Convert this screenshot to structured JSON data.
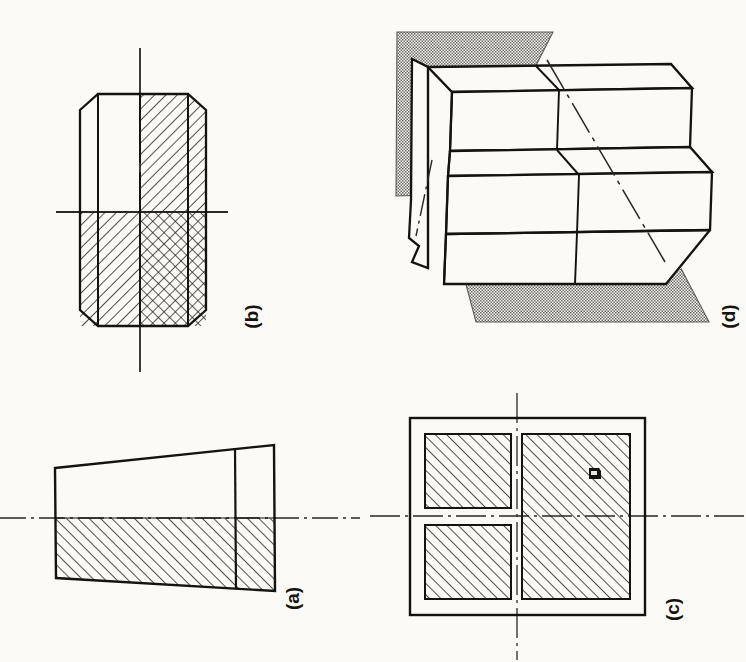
{
  "page": {
    "background_color": "#fbfaf7",
    "ink_color": "#15120f",
    "hatch_color": "#1a1714",
    "plane_fill_color": "#b7b4ae",
    "width": 746,
    "height": 662
  },
  "figures": [
    {
      "id": "a",
      "label": "(a)",
      "kind": "half-section-tapered-block",
      "description": "Tapered wedge block shown in half section; lower half hatched at 45 degrees, centre line running horizontally through the part",
      "label_rotation_deg": -90,
      "centerline": {
        "orientation": "horizontal",
        "style": "dash-dot"
      },
      "hatch_angle_deg": 45,
      "hatch_spacing_px": 7
    },
    {
      "id": "b",
      "label": "(b)",
      "kind": "hex-body-quarter-section",
      "description": "Hexagonal bodied cylindrical part; upper right quadrant and lower left quadrant hatched one way, lower right quadrant cross hatched, vertical and horizontal centre lines",
      "label_rotation_deg": -90,
      "centerline": {
        "orientation": "cross",
        "style": "continuous"
      },
      "hatch_angle_deg": 45,
      "hatch_spacing_px": 7
    },
    {
      "id": "c",
      "label": "(c)",
      "kind": "square-section-four-quadrants",
      "description": "Square outline with inner hatched regions; two separate squares at left, one tall hatched rectangle at right, crossed dash-dot centre lines",
      "label_rotation_deg": -90,
      "centerline": {
        "orientation": "cross",
        "style": "dash-dot"
      },
      "hatch_angle_deg": 45,
      "hatch_spacing_px": 7,
      "artifact": "small dark ink smudge inside right hatched region"
    },
    {
      "id": "d",
      "label": "(d)",
      "kind": "pictorial-stepped-block-with-cutting-planes",
      "description": "Isometric pictorial of a stepped block with a V notch at its left end, intersected by two shaded cutting planes, one above and one below, with a dash-dot trace line across the body",
      "label_rotation_deg": -90,
      "plane_count": 2,
      "plane_shading": "stippled grey",
      "trace_line_style": "dash-dot"
    }
  ]
}
